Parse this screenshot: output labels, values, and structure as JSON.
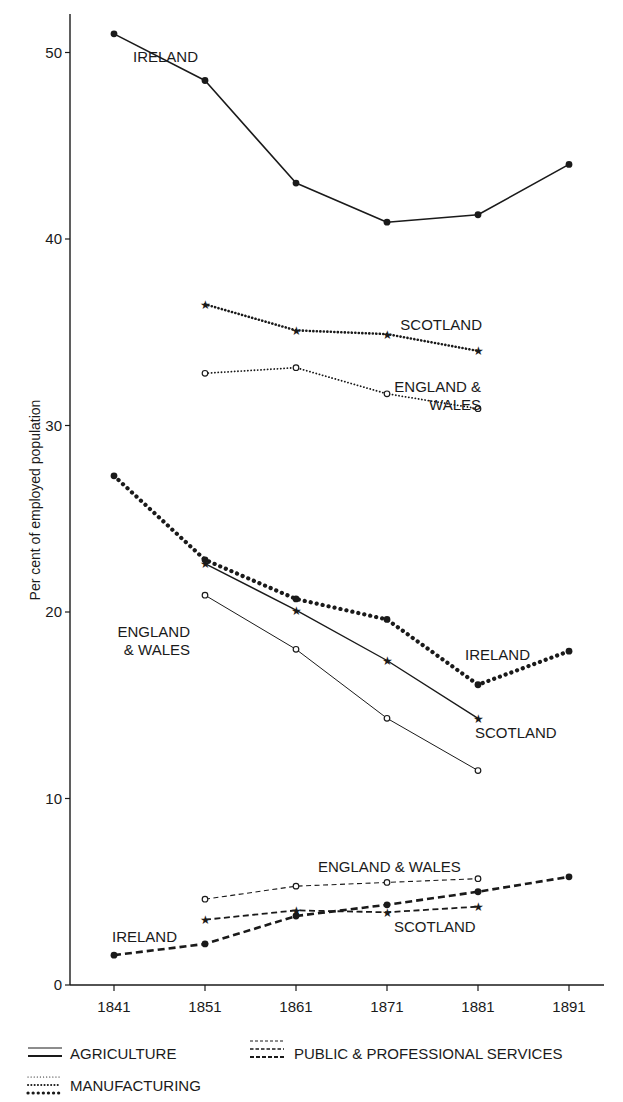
{
  "chart_data": {
    "type": "line",
    "title": "",
    "xlabel": "",
    "ylabel": "Per cent of employed population",
    "x": [
      1841,
      1851,
      1861,
      1871,
      1881,
      1891
    ],
    "ylim": [
      0,
      52
    ],
    "yticks": [
      0,
      10,
      20,
      30,
      40,
      50
    ],
    "grid": false,
    "legend_position": "bottom",
    "legend": [
      {
        "sector": "agriculture",
        "label": "AGRICULTURE",
        "style": "solid"
      },
      {
        "sector": "services",
        "label": "PUBLIC & PROFESSIONAL SERVICES",
        "style": "dashed"
      },
      {
        "sector": "manufacturing",
        "label": "MANUFACTURING",
        "style": "dotted"
      }
    ],
    "series": [
      {
        "name": "Agriculture - Ireland",
        "sector": "agriculture",
        "region": "Ireland",
        "marker": "dot",
        "x": [
          1841,
          1851,
          1861,
          1871,
          1881,
          1891
        ],
        "values": [
          51.0,
          48.5,
          43.0,
          40.9,
          41.3,
          44.0
        ]
      },
      {
        "name": "Agriculture - Scotland",
        "sector": "agriculture",
        "region": "Scotland",
        "marker": "star",
        "x": [
          1851,
          1861,
          1871,
          1881
        ],
        "values": [
          22.6,
          20.1,
          17.4,
          14.3
        ]
      },
      {
        "name": "Agriculture - England & Wales",
        "sector": "agriculture",
        "region": "England & Wales",
        "marker": "circle",
        "x": [
          1851,
          1861,
          1871,
          1881
        ],
        "values": [
          20.9,
          18.0,
          14.3,
          11.5
        ]
      },
      {
        "name": "Manufacturing - Scotland",
        "sector": "manufacturing",
        "region": "Scotland",
        "marker": "star",
        "x": [
          1851,
          1861,
          1871,
          1881
        ],
        "values": [
          36.5,
          35.1,
          34.9,
          34.0
        ]
      },
      {
        "name": "Manufacturing - England & Wales",
        "sector": "manufacturing",
        "region": "England & Wales",
        "marker": "circle",
        "x": [
          1851,
          1861,
          1871,
          1881
        ],
        "values": [
          32.8,
          33.1,
          31.7,
          30.9
        ]
      },
      {
        "name": "Manufacturing - Ireland",
        "sector": "manufacturing",
        "region": "Ireland",
        "marker": "dot",
        "x": [
          1841,
          1851,
          1861,
          1871,
          1881,
          1891
        ],
        "values": [
          27.3,
          22.8,
          20.7,
          19.6,
          16.1,
          17.9
        ]
      },
      {
        "name": "Public & Professional Services - England & Wales",
        "sector": "services",
        "region": "England & Wales",
        "marker": "circle",
        "x": [
          1851,
          1861,
          1871,
          1881
        ],
        "values": [
          4.6,
          5.3,
          5.5,
          5.7
        ]
      },
      {
        "name": "Public & Professional Services - Scotland",
        "sector": "services",
        "region": "Scotland",
        "marker": "star",
        "x": [
          1851,
          1861,
          1871,
          1881
        ],
        "values": [
          3.5,
          4.0,
          3.9,
          4.2
        ]
      },
      {
        "name": "Public & Professional Services - Ireland",
        "sector": "services",
        "region": "Ireland",
        "marker": "dot",
        "x": [
          1841,
          1851,
          1861,
          1871,
          1881,
          1891
        ],
        "values": [
          1.6,
          2.2,
          3.7,
          4.3,
          5.0,
          5.8
        ]
      }
    ],
    "annotations": [
      {
        "text": "IRELAND",
        "x": 133,
        "y": 62,
        "anchor": "start"
      },
      {
        "text": "SCOTLAND",
        "x": 482,
        "y": 330,
        "anchor": "end"
      },
      {
        "text": "ENGLAND &",
        "x": 481,
        "y": 392,
        "anchor": "end"
      },
      {
        "text": "WALES",
        "x": 481,
        "y": 410,
        "anchor": "end"
      },
      {
        "text": "ENGLAND",
        "x": 190,
        "y": 637,
        "anchor": "end"
      },
      {
        "text": "& WALES",
        "x": 190,
        "y": 655,
        "anchor": "end"
      },
      {
        "text": "IRELAND",
        "x": 530,
        "y": 660,
        "anchor": "end"
      },
      {
        "text": "SCOTLAND",
        "x": 475,
        "y": 738,
        "anchor": "start"
      },
      {
        "text": "ENGLAND & WALES",
        "x": 318,
        "y": 872,
        "anchor": "start"
      },
      {
        "text": "SCOTLAND",
        "x": 394,
        "y": 932,
        "anchor": "start"
      },
      {
        "text": "IRELAND",
        "x": 112,
        "y": 942,
        "anchor": "start"
      }
    ]
  }
}
